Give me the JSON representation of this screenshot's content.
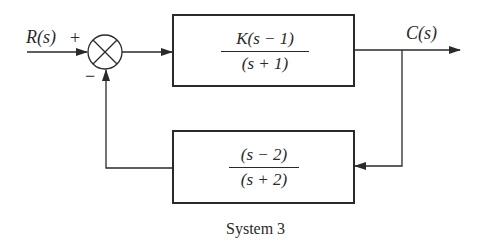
{
  "diagram": {
    "type": "block-diagram",
    "title": "System 3",
    "input": {
      "label": "R(s)",
      "sign": "+"
    },
    "summing_junction": {
      "feedback_sign": "−"
    },
    "forward_block": {
      "numerator": "K(s − 1)",
      "denominator": "(s + 1)"
    },
    "feedback_block": {
      "numerator": "(s − 2)",
      "denominator": "(s + 2)"
    },
    "output": {
      "label": "C(s)"
    },
    "caption": "System 3",
    "colors": {
      "line": "#2a2a2a",
      "background": "#ffffff"
    }
  }
}
